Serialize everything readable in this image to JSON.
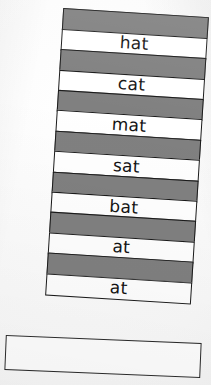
{
  "scene": {
    "title": "Word family tower",
    "description": "A tilted stack of alternating gray and white paper strips forming a tower of -at word family words, resting on a wide blank base strip.",
    "colors": {
      "spacer_fill": "#808080",
      "card_fill": "#ffffff",
      "outline": "#1a1a1a",
      "background": "#fbfbfb"
    }
  },
  "tower": {
    "strips": [
      {
        "kind": "spacer",
        "label": ""
      },
      {
        "kind": "word",
        "label": "hat"
      },
      {
        "kind": "spacer",
        "label": ""
      },
      {
        "kind": "word",
        "label": "cat"
      },
      {
        "kind": "spacer",
        "label": ""
      },
      {
        "kind": "word",
        "label": "mat"
      },
      {
        "kind": "spacer",
        "label": ""
      },
      {
        "kind": "word",
        "label": "sat"
      },
      {
        "kind": "spacer",
        "label": ""
      },
      {
        "kind": "word",
        "label": "bat"
      },
      {
        "kind": "spacer",
        "label": ""
      },
      {
        "kind": "word",
        "label": "at"
      },
      {
        "kind": "spacer",
        "label": ""
      },
      {
        "kind": "word",
        "label": "at"
      }
    ]
  },
  "base": {
    "label": ""
  }
}
